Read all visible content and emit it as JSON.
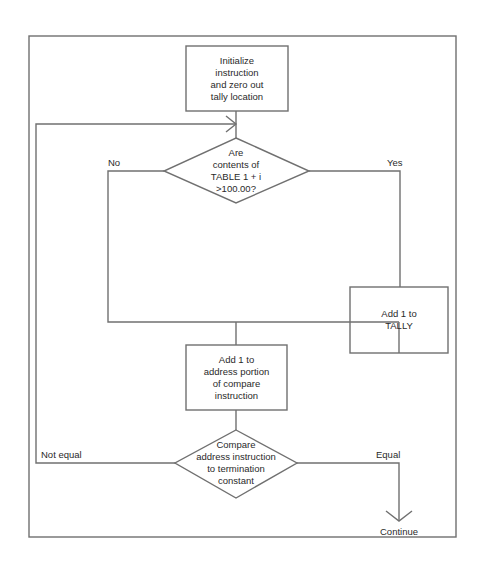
{
  "diagram": {
    "type": "flowchart",
    "colors": {
      "line": "#707070",
      "text": "#2a2a2a",
      "background": "#ffffff"
    },
    "nodes": {
      "init": {
        "shape": "rectangle",
        "lines": [
          "Initialize",
          "instruction",
          "and zero out",
          "tally location"
        ]
      },
      "decision1": {
        "shape": "diamond",
        "lines": [
          "Are",
          "contents of",
          "TABLE  1 + i",
          ">100.00?"
        ]
      },
      "add_tally": {
        "shape": "rectangle",
        "lines": [
          "Add 1 to",
          "TALLY"
        ]
      },
      "add_address": {
        "shape": "rectangle",
        "lines": [
          "Add 1 to",
          "address portion",
          "of compare",
          "instruction"
        ]
      },
      "decision2": {
        "shape": "diamond",
        "lines": [
          "Compare",
          "address instruction",
          "to termination",
          "constant"
        ]
      }
    },
    "edge_labels": {
      "no": "No",
      "yes": "Yes",
      "not_equal": "Not equal",
      "equal": "Equal",
      "continue": "Continue"
    },
    "edges": [
      {
        "from": "init",
        "to": "decision1"
      },
      {
        "from": "decision1",
        "to": "add_tally",
        "label": "Yes"
      },
      {
        "from": "decision1",
        "to": "add_address",
        "label": "No"
      },
      {
        "from": "add_tally",
        "to": "add_address"
      },
      {
        "from": "add_address",
        "to": "decision2"
      },
      {
        "from": "decision2",
        "to": "decision1",
        "label": "Not equal"
      },
      {
        "from": "decision2",
        "to": "continue",
        "label": "Equal"
      }
    ]
  }
}
